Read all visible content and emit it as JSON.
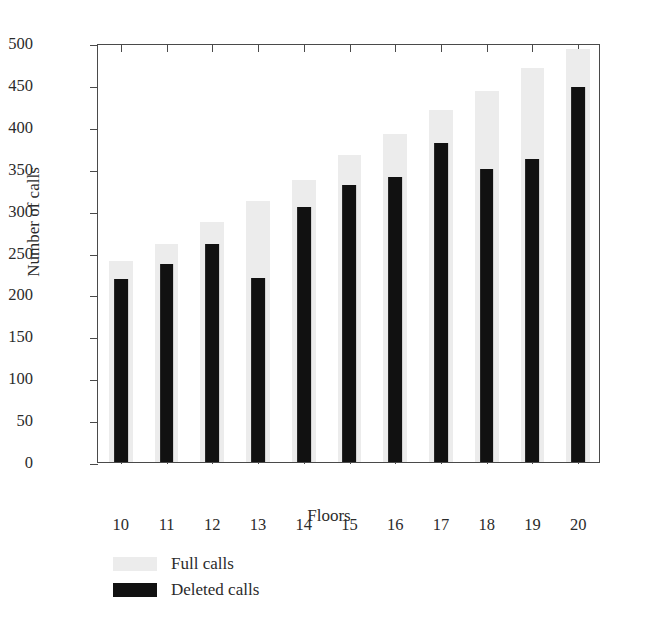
{
  "chart_data": {
    "type": "bar",
    "title": "",
    "xlabel": "Floors",
    "ylabel": "Number of calls",
    "categories": [
      "10",
      "11",
      "12",
      "13",
      "14",
      "15",
      "16",
      "17",
      "18",
      "19",
      "20"
    ],
    "series": [
      {
        "name": "Full calls",
        "color": "#ececec",
        "values": [
          240,
          260,
          287,
          312,
          337,
          366,
          392,
          420,
          443,
          470,
          493
        ]
      },
      {
        "name": "Deleted calls",
        "color": "#111111",
        "values": [
          218,
          236,
          260,
          220,
          304,
          331,
          340,
          381,
          350,
          361,
          448
        ]
      }
    ],
    "ylim": [
      0,
      500
    ],
    "yticks": [
      0,
      50,
      100,
      150,
      200,
      250,
      300,
      350,
      400,
      450,
      500
    ],
    "ytick_labels": [
      "0",
      "50",
      "100",
      "150",
      "200",
      "250",
      "300",
      "350",
      "400",
      "450",
      "500"
    ],
    "grid": false,
    "legend_position": "below-axes-left",
    "overlay_style": "overlaid"
  },
  "axis": {
    "y_title": "Number of calls",
    "x_title": "Floors"
  },
  "legend": {
    "entries": [
      {
        "label": "Full calls",
        "color": "#ececec"
      },
      {
        "label": "Deleted calls",
        "color": "#111111"
      }
    ]
  },
  "colors": {
    "full_calls": "#ececec",
    "deleted_calls": "#111111",
    "axis": "#4a4a4a",
    "text": "#2b2b2b",
    "background": "#ffffff"
  }
}
